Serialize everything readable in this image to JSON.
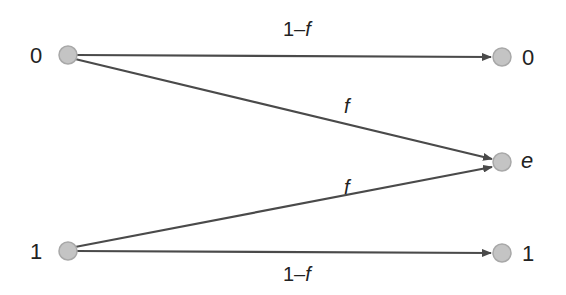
{
  "diagram": {
    "colors": {
      "edge": "#4a4a4a",
      "node_fill": "#c4c4c4",
      "node_stroke": "#a8a8a8",
      "text": "#222222"
    },
    "inputs": [
      {
        "label": "0",
        "x": 68,
        "y": 55
      },
      {
        "label": "1",
        "x": 68,
        "y": 251
      }
    ],
    "outputs": [
      {
        "label": "0",
        "x": 502,
        "y": 57
      },
      {
        "label": "e",
        "x": 502,
        "y": 162
      },
      {
        "label": "1",
        "x": 502,
        "y": 253
      }
    ],
    "edges": [
      {
        "from": "0",
        "to": "0",
        "label_num": "1–",
        "label_var": "f"
      },
      {
        "from": "0",
        "to": "e",
        "label_num": "",
        "label_var": "f"
      },
      {
        "from": "1",
        "to": "e",
        "label_num": "",
        "label_var": "f"
      },
      {
        "from": "1",
        "to": "1",
        "label_num": "1–",
        "label_var": "f"
      }
    ]
  }
}
